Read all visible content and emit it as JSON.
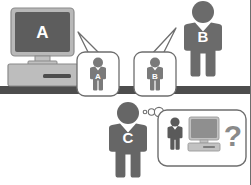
{
  "diagram": {
    "background_color": "#ffffff",
    "floor_bar": {
      "label": "ground-line",
      "color": "#4d4d4d"
    },
    "computer": {
      "label": "desktop-computer",
      "screen_letter": "A",
      "screen_color": "#5d5d5d",
      "case_color": "#b8b8b8",
      "outline_color": "#8a8a8a",
      "letter_color": "#ffffff"
    },
    "speech_bubbles": [
      {
        "id": "bubble-a",
        "figure_letter": "A",
        "figure_color": "#7a7a7a",
        "bubble_fill": "#ffffff",
        "bubble_stroke": "#6e6e6e",
        "tail_direction": "up-left"
      },
      {
        "id": "bubble-b",
        "figure_letter": "B",
        "figure_color": "#7a7a7a",
        "bubble_fill": "#ffffff",
        "bubble_stroke": "#6e6e6e",
        "tail_direction": "up-right"
      }
    ],
    "figures": [
      {
        "id": "person-b",
        "letter": "B",
        "color": "#6b6b6b",
        "letter_color": "#ffffff",
        "position": "top-right"
      },
      {
        "id": "person-c",
        "letter": "C",
        "color": "#666666",
        "letter_color": "#ffffff",
        "position": "bottom-center"
      }
    ],
    "thought_bubble": {
      "id": "thought-bubble-c",
      "fill": "#ffffff",
      "stroke": "#6e6e6e",
      "dots": 2,
      "contents": {
        "person": {
          "label": "person-icon",
          "color": "#5a5a5a"
        },
        "computer": {
          "label": "computer-icon",
          "screen_color": "#8f8f8f",
          "case_color": "#c2c2c2"
        },
        "question_mark": {
          "label": "question-mark",
          "text": "?",
          "color": "#8a8a8a"
        }
      }
    }
  }
}
